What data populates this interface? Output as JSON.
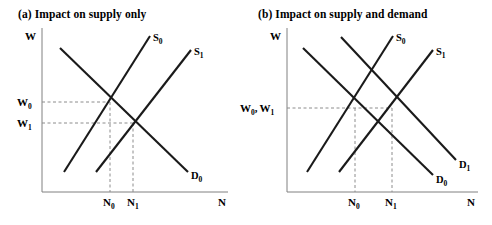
{
  "figure": {
    "width": 492,
    "height": 225,
    "background": "#ffffff",
    "ink_color": "#1a1a1a",
    "axis_color": "#808080",
    "dash_color": "#8c8c8c"
  },
  "panels": [
    {
      "id": "panel-a",
      "title": "(a) Impact on supply only",
      "y_axis_label": "W",
      "x_axis_label": "N",
      "y_ticks": [
        {
          "label": "W",
          "sub": "0",
          "value_y": 102
        },
        {
          "label": "W",
          "sub": "1",
          "value_y": 123
        }
      ],
      "x_ticks": [
        {
          "label": "N",
          "sub": "0",
          "value_x": 110
        },
        {
          "label": "N",
          "sub": "1",
          "value_x": 133
        }
      ],
      "curves": [
        {
          "name": "S",
          "sub": "0",
          "label": "S0",
          "type": "supply",
          "x1": 64,
          "y1": 172,
          "x2": 150,
          "y2": 36
        },
        {
          "name": "S",
          "sub": "1",
          "label": "S1",
          "type": "supply",
          "x1": 96,
          "y1": 172,
          "x2": 191,
          "y2": 50
        },
        {
          "name": "D",
          "sub": "0",
          "label": "D0",
          "type": "demand",
          "x1": 60,
          "y1": 48,
          "x2": 188,
          "y2": 172
        }
      ],
      "equilibria": [
        {
          "label": "E0",
          "x": 110,
          "y": 102
        },
        {
          "label": "E1",
          "x": 133,
          "y": 123
        }
      ]
    },
    {
      "id": "panel-b",
      "title": "(b) Impact on supply and demand",
      "y_axis_label": "W",
      "x_axis_label": "N",
      "y_ticks": [
        {
          "label": "W0, W1",
          "sub": "",
          "value_y": 108
        }
      ],
      "x_ticks": [
        {
          "label": "N",
          "sub": "0",
          "value_x": 355
        },
        {
          "label": "N",
          "sub": "1",
          "value_x": 392
        }
      ],
      "curves": [
        {
          "name": "S",
          "sub": "0",
          "label": "S0",
          "type": "supply",
          "x1": 307,
          "y1": 172,
          "x2": 393,
          "y2": 36
        },
        {
          "name": "S",
          "sub": "1",
          "label": "S1",
          "type": "supply",
          "x1": 339,
          "y1": 172,
          "x2": 433,
          "y2": 50
        },
        {
          "name": "D",
          "sub": "0",
          "label": "D0",
          "type": "demand",
          "x1": 303,
          "y1": 48,
          "x2": 433,
          "y2": 175
        },
        {
          "name": "D",
          "sub": "1",
          "label": "D1",
          "type": "demand",
          "x1": 341,
          "y1": 37,
          "x2": 456,
          "y2": 160
        }
      ],
      "equilibria": [
        {
          "label": "E0",
          "x": 355,
          "y": 108
        },
        {
          "label": "E1",
          "x": 392,
          "y": 108
        }
      ]
    }
  ],
  "labels": {
    "W": "W",
    "N": "N",
    "S": "S",
    "D": "D",
    "W0": "W",
    "W1": "W",
    "W0W1": "W",
    "comma": ",",
    "sub0": "0",
    "sub1": "1"
  }
}
